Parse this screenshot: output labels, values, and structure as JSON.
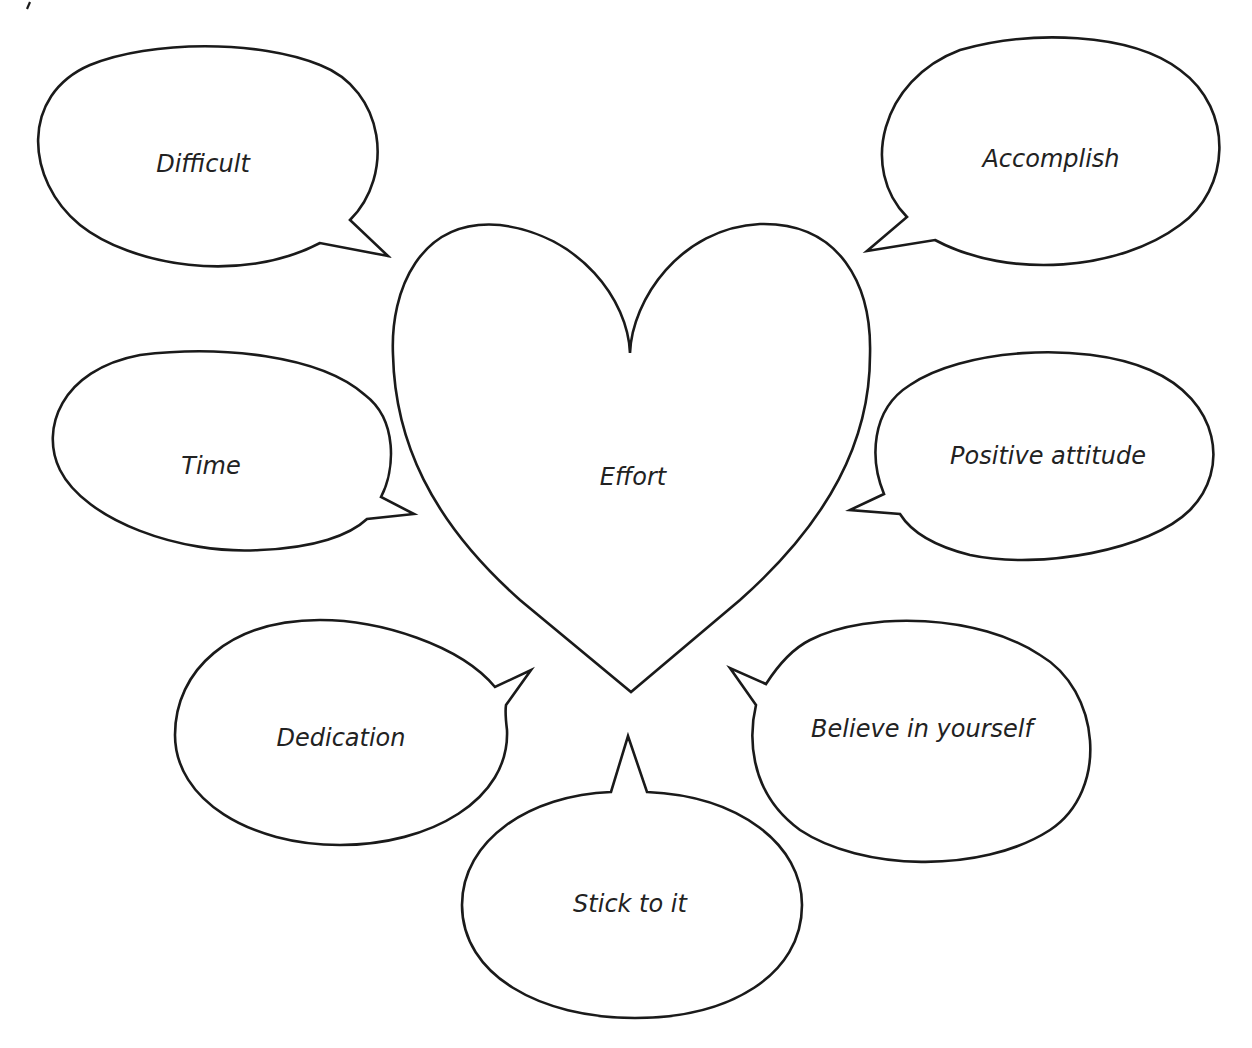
{
  "diagram": {
    "type": "concept-web",
    "center": {
      "label": "Effort",
      "shape": "heart"
    },
    "bubbles": [
      {
        "label": "Difficult",
        "position": "top-left"
      },
      {
        "label": "Accomplish",
        "position": "top-right"
      },
      {
        "label": "Time",
        "position": "middle-left"
      },
      {
        "label": "Positive attitude",
        "position": "middle-right"
      },
      {
        "label": "Dedication",
        "position": "bottom-left"
      },
      {
        "label": "Believe in yourself",
        "position": "bottom-right"
      },
      {
        "label": "Stick to it",
        "position": "bottom-center"
      }
    ],
    "colors": {
      "stroke": "#1a1a1a",
      "fill": "#ffffff",
      "text": "#222222"
    }
  }
}
